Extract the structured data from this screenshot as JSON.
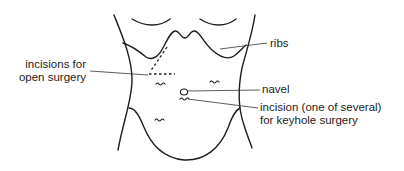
{
  "figure": {
    "labels": {
      "ribs": "ribs",
      "navel": "navel",
      "open_surgery_line1": "incisions for",
      "open_surgery_line2": "open surgery",
      "keyhole_line1": "incision (one of several)",
      "keyhole_line2": "for keyhole surgery"
    },
    "colors": {
      "line": "#1e1e1e",
      "text": "#222222",
      "background": "#ffffff"
    }
  }
}
